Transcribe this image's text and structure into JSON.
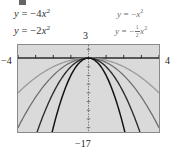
{
  "figure": {
    "name": "parabola-family-graph",
    "background": "#ffffff",
    "plot_background": "#dadada",
    "frame_color": "#8a8a8a"
  },
  "equations": {
    "left": [
      {
        "id": "eq-neg4x2",
        "y": "y",
        "eq": "=",
        "sign": "−",
        "coef": "4",
        "var": "x",
        "exp": "2",
        "full": "y = −4x²"
      },
      {
        "id": "eq-neg2x2",
        "y": "y",
        "eq": "=",
        "sign": "−",
        "coef": "2",
        "var": "x",
        "exp": "2",
        "full": "y = −2x²"
      }
    ],
    "right": [
      {
        "id": "eq-negx2",
        "y": "y",
        "eq": "=",
        "sign": "−",
        "coef": "",
        "var": "x",
        "exp": "2",
        "full": "y = −x²"
      },
      {
        "id": "eq-neghalfx2",
        "y": "y",
        "eq": "=",
        "sign": "−",
        "num": "1",
        "den": "2",
        "var": "x",
        "exp": "2",
        "full": "y = −½x²"
      }
    ]
  },
  "axes": {
    "x_min_label": "−4",
    "x_max_label": "4",
    "y_max_label": "3",
    "y_min_label": "−17",
    "x_axis_color": "#2b2b2b",
    "y_axis_color": "#6a6a6a",
    "tick_color": "#2b2b2b"
  },
  "chart_data": {
    "type": "line",
    "title": "",
    "xlabel": "",
    "ylabel": "",
    "xlim": [
      -4,
      4
    ],
    "ylim": [
      -17,
      3
    ],
    "grid": false,
    "legend": "inline-labels",
    "x_ticks": [
      -4,
      -3,
      -2,
      -1,
      0,
      1,
      2,
      3,
      4
    ],
    "y_ticks": [
      -16,
      -14,
      -12,
      -10,
      -8,
      -6,
      -4,
      -2,
      0,
      2
    ],
    "series": [
      {
        "name": "y = −4x²",
        "coefficient": -4,
        "color": "#111111",
        "width": 1.5,
        "x": [
          -2.06,
          -1.75,
          -1.5,
          -1.25,
          -1.0,
          -0.75,
          -0.5,
          -0.25,
          0,
          0.25,
          0.5,
          0.75,
          1.0,
          1.25,
          1.5,
          1.75,
          2.06
        ],
        "values": [
          -17.0,
          -12.25,
          -9.0,
          -6.25,
          -4.0,
          -2.25,
          -1.0,
          -0.25,
          0,
          -0.25,
          -1.0,
          -2.25,
          -4.0,
          -6.25,
          -9.0,
          -12.25,
          -17.0
        ]
      },
      {
        "name": "y = −2x²",
        "coefficient": -2,
        "color": "#2e2e2e",
        "width": 1.4,
        "x": [
          -2.92,
          -2.5,
          -2.0,
          -1.5,
          -1.0,
          -0.5,
          0,
          0.5,
          1.0,
          1.5,
          2.0,
          2.5,
          2.92
        ],
        "values": [
          -17.0,
          -12.5,
          -8.0,
          -4.5,
          -2.0,
          -0.5,
          0,
          -0.5,
          -2.0,
          -4.5,
          -8.0,
          -12.5,
          -17.0
        ]
      },
      {
        "name": "y = −x²",
        "coefficient": -1,
        "color": "#707070",
        "width": 1.3,
        "x": [
          -4,
          -3.5,
          -3,
          -2.5,
          -2,
          -1.5,
          -1,
          -0.5,
          0,
          0.5,
          1,
          1.5,
          2,
          2.5,
          3,
          3.5,
          4
        ],
        "values": [
          -16.0,
          -12.25,
          -9.0,
          -6.25,
          -4.0,
          -2.25,
          -1.0,
          -0.25,
          0,
          -0.25,
          -1.0,
          -2.25,
          -4.0,
          -6.25,
          -9.0,
          -12.25,
          -16.0
        ]
      },
      {
        "name": "y = −½x²",
        "coefficient": -0.5,
        "color": "#9a9a9a",
        "width": 1.3,
        "x": [
          -4,
          -3.5,
          -3,
          -2.5,
          -2,
          -1.5,
          -1,
          -0.5,
          0,
          0.5,
          1,
          1.5,
          2,
          2.5,
          3,
          3.5,
          4
        ],
        "values": [
          -8.0,
          -6.125,
          -4.5,
          -3.125,
          -2.0,
          -1.125,
          -0.5,
          -0.125,
          0,
          -0.125,
          -0.5,
          -1.125,
          -2.0,
          -3.125,
          -4.5,
          -6.125,
          -8.0
        ]
      }
    ]
  }
}
